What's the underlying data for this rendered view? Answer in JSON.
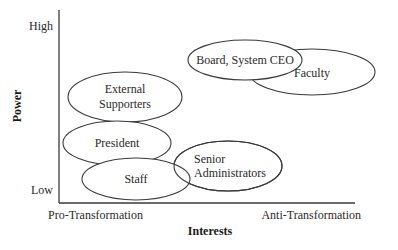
{
  "diagram": {
    "type": "stakeholder-map",
    "axes": {
      "x": {
        "title": "Interests",
        "low_label": "Pro-Transformation",
        "high_label": "Anti-Transformation"
      },
      "y": {
        "title": "Power",
        "low_label": "Low",
        "high_label": "High"
      }
    },
    "stakeholders": [
      {
        "id": "external-supporters",
        "lines": [
          "External",
          "Supporters"
        ],
        "interest": "pro",
        "power": "medium-high"
      },
      {
        "id": "president",
        "lines": [
          "President"
        ],
        "interest": "pro",
        "power": "medium-low"
      },
      {
        "id": "staff",
        "lines": [
          "Staff"
        ],
        "interest": "pro-neutral",
        "power": "low"
      },
      {
        "id": "senior-administrators",
        "lines": [
          "Senior",
          "Administrators"
        ],
        "interest": "neutral",
        "power": "low"
      },
      {
        "id": "board-system-ceo",
        "lines": [
          "Board, System CEO"
        ],
        "interest": "neutral-anti",
        "power": "high"
      },
      {
        "id": "faculty",
        "lines": [
          "Faculty"
        ],
        "interest": "anti",
        "power": "high"
      }
    ],
    "colors": {
      "stroke": "#3a3a3a",
      "fill": "#ffffff",
      "text": "#2a2a2a"
    }
  }
}
